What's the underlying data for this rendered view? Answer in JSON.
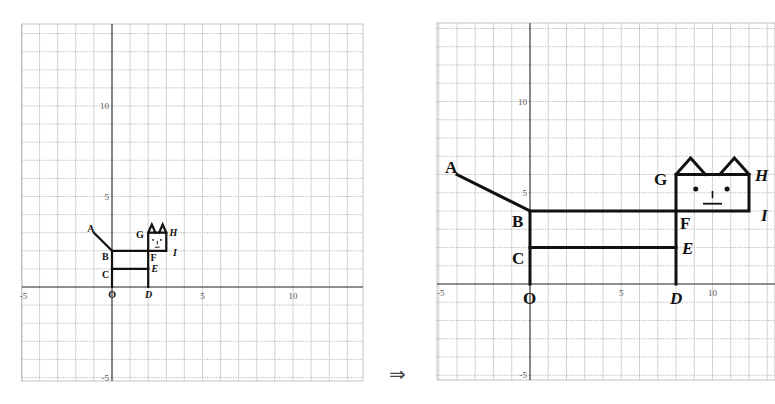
{
  "arrow": "⇒",
  "chart_data": [
    {
      "type": "line",
      "title": "Original figure (cat)",
      "xlabel": "",
      "ylabel": "",
      "xlim": [
        -5,
        14
      ],
      "ylim": [
        -5,
        14
      ],
      "grid": true,
      "x_ticks": [
        "-5",
        "5",
        "10"
      ],
      "y_ticks": [
        "10",
        "5",
        "-5"
      ],
      "origin_label": "O",
      "points": {
        "A": [
          -1,
          3
        ],
        "B": [
          0,
          2
        ],
        "C": [
          0,
          1
        ],
        "O": [
          0,
          0
        ],
        "D": [
          2,
          0
        ],
        "E": [
          2,
          1
        ],
        "F": [
          2,
          2
        ],
        "G": [
          2,
          3
        ],
        "H": [
          3,
          3
        ],
        "I": [
          3,
          2
        ]
      }
    },
    {
      "type": "line",
      "title": "Transformed figure (x×4, y×2)",
      "xlabel": "",
      "ylabel": "",
      "xlim": [
        -5,
        13
      ],
      "ylim": [
        -5,
        14
      ],
      "grid": true,
      "x_ticks": [
        "-5",
        "5",
        "10"
      ],
      "y_ticks": [
        "10",
        "5",
        "-5"
      ],
      "origin_label": "O",
      "points": {
        "A": [
          -4,
          6
        ],
        "B": [
          0,
          4
        ],
        "C": [
          0,
          2
        ],
        "O": [
          0,
          0
        ],
        "D": [
          8,
          0
        ],
        "E": [
          8,
          2
        ],
        "F": [
          8,
          4
        ],
        "G": [
          8,
          6
        ],
        "H": [
          12,
          6
        ],
        "I": [
          12,
          4
        ]
      }
    }
  ],
  "labels": {
    "A": "A",
    "B": "B",
    "C": "C",
    "O": "O",
    "D": "D",
    "E": "E",
    "F": "F",
    "G": "G",
    "H": "H",
    "I": "I"
  },
  "ticks": {
    "neg5": "-5",
    "five": "5",
    "ten": "10"
  }
}
